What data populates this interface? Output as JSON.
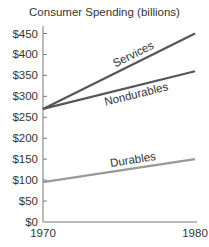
{
  "chart_data": {
    "type": "line",
    "title": "Consumer Spending (billions)",
    "xlabel": "",
    "ylabel": "",
    "x": [
      1970,
      1980
    ],
    "x_tick_labels": [
      "1970",
      "1980"
    ],
    "y_tick_labels": [
      "$0",
      "$50",
      "$100",
      "$150",
      "$200",
      "$250",
      "$300",
      "$350",
      "$400",
      "$450"
    ],
    "ylim": [
      0,
      450
    ],
    "grid": false,
    "legend": "inline labels on lines",
    "series": [
      {
        "name": "Services",
        "values": [
          270,
          450
        ],
        "color": "#555555"
      },
      {
        "name": "Nondurables",
        "values": [
          270,
          360
        ],
        "color": "#555555"
      },
      {
        "name": "Durables",
        "values": [
          95,
          150
        ],
        "color": "#999999"
      }
    ]
  }
}
